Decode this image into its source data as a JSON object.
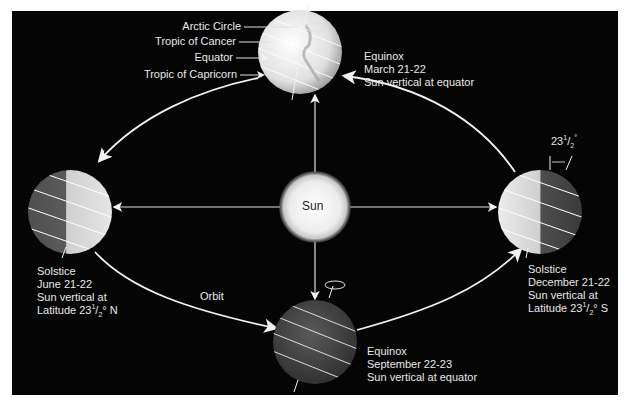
{
  "diagram": {
    "center": {
      "label": "Sun"
    },
    "orbit_label": "Orbit",
    "latitude_labels": {
      "arctic_circle": "Arctic Circle",
      "tropic_of_cancer": "Tropic of Cancer",
      "equator": "Equator",
      "tropic_of_capricorn": "Tropic of Capricorn"
    },
    "tilt_label": {
      "whole": "23",
      "num": "1",
      "den": "2",
      "unit": "°"
    },
    "positions": [
      {
        "id": "march",
        "line1": "Equinox",
        "line2": "March 21-22",
        "line3": "Sun vertical at equator"
      },
      {
        "id": "june",
        "line1": "Solstice",
        "line2": "June 21-22",
        "line3": "Sun vertical at",
        "line4_prefix": "Latitude 23",
        "line4_num": "1",
        "line4_den": "2",
        "line4_suffix": "° N"
      },
      {
        "id": "september",
        "line1": "Equinox",
        "line2": "September 22-23",
        "line3": "Sun vertical at equator"
      },
      {
        "id": "december",
        "line1": "Solstice",
        "line2": "December 21-22",
        "line3": "Sun vertical at",
        "line4_prefix": "Latitude 23",
        "line4_num": "1",
        "line4_den": "2",
        "line4_suffix": "° S"
      }
    ]
  },
  "colors": {
    "background": "#050505",
    "text": "#e8e8e8",
    "orbit": "#f2f2f2",
    "sun": "#f4f4f4",
    "earth_light": "#e6e6e6",
    "earth_dark": "#4a4a4a"
  }
}
